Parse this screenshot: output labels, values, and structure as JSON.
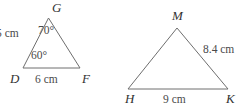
{
  "figure": {
    "background_color": "#ffffff",
    "stroke_color": "#6e6e6e",
    "text_color": "#4a4a4a",
    "width": 250,
    "height": 112
  },
  "triangle_left": {
    "name": "triangle-DGF",
    "vertices": {
      "apex": "G",
      "bottom_left": "D",
      "bottom_right": "F"
    },
    "angles": {
      "at_apex": "70°",
      "at_bottom_left": "60°"
    },
    "sides": {
      "left": "5 cm",
      "base": "6 cm"
    }
  },
  "triangle_right": {
    "name": "triangle-HMK",
    "vertices": {
      "apex": "M",
      "bottom_left": "H",
      "bottom_right": "K"
    },
    "sides": {
      "right": "8.4 cm",
      "base": "9 cm"
    }
  }
}
